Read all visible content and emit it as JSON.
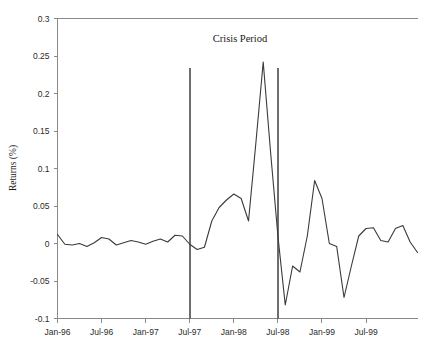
{
  "chart_data": {
    "type": "line",
    "title": "Crisis Period",
    "xlabel": "",
    "ylabel": "Returns (%)",
    "ylim": [
      -0.1,
      0.3
    ],
    "grid": false,
    "legend": "none",
    "y_ticks": [
      0.3,
      0.25,
      0.2,
      0.15,
      0.1,
      0.05,
      0,
      -0.05,
      -0.1
    ],
    "y_tick_labels": [
      "0.3",
      "0.25",
      "0.2",
      "0.15",
      "0.1",
      "0.05",
      "0",
      "-0.05",
      "-0.1"
    ],
    "x_ticks": [
      "Jan-96",
      "Jul-96",
      "Jan-97",
      "Jul-97",
      "Jan-98",
      "Jul-98",
      "Jan-99",
      "Jul-99"
    ],
    "x_tick_months": [
      0,
      6,
      12,
      18,
      24,
      30,
      36,
      42
    ],
    "x_range_months": [
      0,
      49
    ],
    "annotations": [
      {
        "name": "crisis-start-line",
        "label": "Crisis Period start",
        "x_month": 18
      },
      {
        "name": "crisis-end-line",
        "label": "Crisis Period end",
        "x_month": 30
      }
    ],
    "series": [
      {
        "name": "Returns",
        "color": "#3a3a3a",
        "x": [
          0,
          1,
          2,
          3,
          4,
          5,
          6,
          7,
          8,
          9,
          10,
          11,
          12,
          13,
          14,
          15,
          16,
          17,
          18,
          19,
          20,
          21,
          22,
          23,
          24,
          25,
          26,
          27,
          28,
          29,
          30,
          31,
          32,
          33,
          34,
          35,
          36,
          37,
          38,
          39,
          40,
          41,
          42,
          43,
          44,
          45,
          46,
          47,
          48,
          49
        ],
        "x_labels": [
          "Jan-96",
          "Feb-96",
          "Mar-96",
          "Apr-96",
          "May-96",
          "Jun-96",
          "Jul-96",
          "Aug-96",
          "Sep-96",
          "Oct-96",
          "Nov-96",
          "Dec-96",
          "Jan-97",
          "Feb-97",
          "Mar-97",
          "Apr-97",
          "May-97",
          "Jun-97",
          "Jul-97",
          "Aug-97",
          "Sep-97",
          "Oct-97",
          "Nov-97",
          "Dec-97",
          "Jan-98",
          "Feb-98",
          "Mar-98",
          "Apr-98",
          "May-98",
          "Jun-98",
          "Jul-98",
          "Aug-98",
          "Sep-98",
          "Oct-98",
          "Nov-98",
          "Dec-98",
          "Jan-99",
          "Feb-99",
          "Mar-99",
          "Apr-99",
          "May-99",
          "Jun-99",
          "Jul-99",
          "Aug-99",
          "Sep-99",
          "Oct-99",
          "Nov-99",
          "Dec-99",
          "Jan-00",
          "Feb-00"
        ],
        "values": [
          0.012,
          -0.001,
          -0.002,
          0.0,
          -0.004,
          0.001,
          0.008,
          0.006,
          -0.002,
          0.001,
          0.004,
          0.002,
          -0.001,
          0.003,
          0.006,
          0.002,
          0.011,
          0.01,
          -0.001,
          -0.008,
          -0.005,
          0.03,
          0.048,
          0.058,
          0.066,
          0.06,
          0.03,
          0.134,
          0.242,
          0.122,
          0.01,
          -0.082,
          -0.03,
          -0.038,
          0.01,
          0.084,
          0.06,
          0.0,
          -0.004,
          -0.072,
          -0.03,
          0.01,
          0.02,
          0.021,
          0.004,
          0.002,
          0.02,
          0.024,
          0.002,
          -0.012
        ]
      }
    ]
  }
}
